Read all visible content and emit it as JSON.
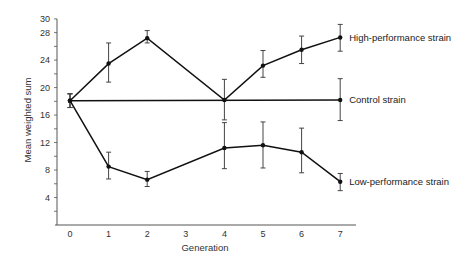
{
  "chart_data": {
    "type": "line",
    "title": "",
    "xlabel": "Generation",
    "ylabel": "Mean weighted sum",
    "x_ticks": [
      0,
      1,
      2,
      3,
      4,
      5,
      6,
      7
    ],
    "y_ticks": [
      4,
      8,
      12,
      16,
      20,
      24,
      28,
      30
    ],
    "y_minor_step": 2,
    "xlim": [
      -0.35,
      7.4
    ],
    "ylim": [
      0,
      30
    ],
    "grid": false,
    "legend_position": "inline-right",
    "error_bars": true,
    "series": [
      {
        "name": "High-performance strain",
        "x": [
          0,
          1,
          2,
          4,
          5,
          6,
          7
        ],
        "values": [
          18.1,
          23.5,
          27.2,
          18.2,
          23.2,
          25.5,
          27.3
        ],
        "err_low": [
          17.1,
          20.8,
          26.5,
          15.3,
          21.5,
          23.5,
          25.3
        ],
        "err_high": [
          19.1,
          26.5,
          28.3,
          21.2,
          25.4,
          27.5,
          29.2
        ]
      },
      {
        "name": "Control strain",
        "x": [
          0,
          7
        ],
        "values": [
          18.1,
          18.2
        ],
        "err_low": [
          17.1,
          15.2
        ],
        "err_high": [
          19.1,
          21.3
        ]
      },
      {
        "name": "Low-performance strain",
        "x": [
          0,
          1,
          2,
          4,
          5,
          6,
          7
        ],
        "values": [
          18.1,
          8.5,
          6.6,
          11.2,
          11.6,
          10.6,
          6.3
        ],
        "err_low": [
          17.1,
          6.7,
          5.6,
          8.2,
          8.3,
          7.6,
          5.0
        ],
        "err_high": [
          19.1,
          10.6,
          7.8,
          14.9,
          15.0,
          14.1,
          7.5
        ]
      }
    ]
  },
  "style": {
    "line_color": "#111111",
    "axis_color": "#555555",
    "errorbar_color": "#444444"
  }
}
